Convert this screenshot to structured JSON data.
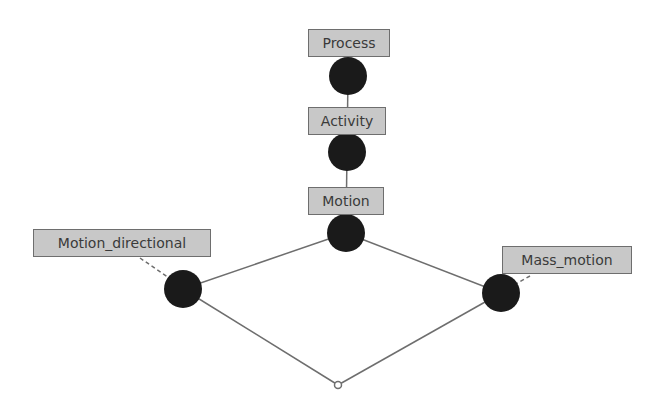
{
  "diagram": {
    "type": "hierarchy-graph",
    "colors": {
      "node_fill": "#1a1a1a",
      "edge": "#6e6e6e",
      "label_bg": "#c8c8c8",
      "label_border": "#6e6e6e",
      "label_text": "#3a3a3a"
    },
    "nodes": [
      {
        "id": "process",
        "label": "Process"
      },
      {
        "id": "activity",
        "label": "Activity"
      },
      {
        "id": "motion",
        "label": "Motion"
      },
      {
        "id": "motion_directional",
        "label": "Motion_directional"
      },
      {
        "id": "mass_motion",
        "label": "Mass_motion"
      },
      {
        "id": "bottom",
        "label": ""
      }
    ],
    "edges": [
      {
        "from": "process",
        "to": "activity"
      },
      {
        "from": "activity",
        "to": "motion"
      },
      {
        "from": "motion",
        "to": "motion_directional"
      },
      {
        "from": "motion",
        "to": "mass_motion"
      },
      {
        "from": "motion_directional",
        "to": "bottom"
      },
      {
        "from": "mass_motion",
        "to": "bottom"
      }
    ]
  }
}
